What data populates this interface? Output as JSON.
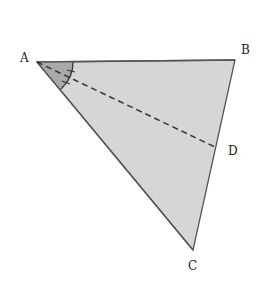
{
  "diagram": {
    "type": "geometry-triangle",
    "vertices": {
      "A": {
        "label": "A",
        "x": 37,
        "y": 62
      },
      "B": {
        "label": "B",
        "x": 235,
        "y": 60
      },
      "C": {
        "label": "C",
        "x": 193,
        "y": 250
      }
    },
    "points": {
      "D": {
        "label": "D",
        "x": 215,
        "y": 147,
        "on_segment": "BC"
      }
    },
    "segments": [
      {
        "from": "A",
        "to": "B",
        "style": "solid"
      },
      {
        "from": "B",
        "to": "C",
        "style": "solid"
      },
      {
        "from": "C",
        "to": "A",
        "style": "solid"
      },
      {
        "from": "A",
        "to": "D",
        "style": "dashed",
        "role": "angle bisector"
      }
    ],
    "angle_marks": [
      {
        "vertex": "A",
        "note": "angle BAC bisected by AD, two equal arcs marked with ticks"
      }
    ],
    "colors": {
      "fill": "#d4d4d4",
      "angle_fill": "#a8a8a8",
      "stroke": "#555555"
    }
  }
}
